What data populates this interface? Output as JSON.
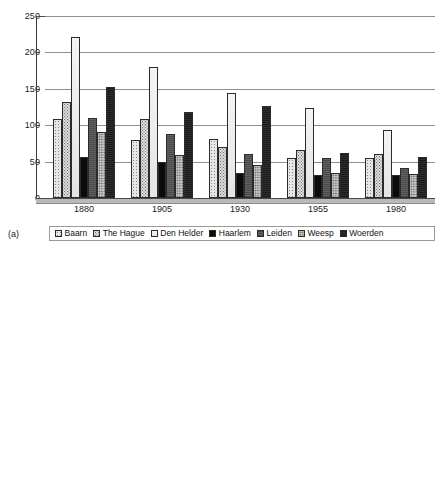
{
  "figure": {
    "panels": [
      {
        "tag": "(a)",
        "chart_data": {
          "type": "bar",
          "title": "",
          "xlabel": "",
          "ylabel": "",
          "categories": [
            "1880",
            "1905",
            "1930",
            "1955",
            "1980"
          ],
          "yticks": [
            0,
            50,
            100,
            150,
            200,
            250
          ],
          "ylim": [
            0,
            250
          ],
          "grid": true,
          "legend_position": "bottom",
          "series": [
            {
              "name": "Baarn",
              "values": [
                109,
                80,
                81,
                55,
                55
              ]
            },
            {
              "name": "The Hague",
              "values": [
                132,
                108,
                70,
                66,
                60
              ]
            },
            {
              "name": "Den Helder",
              "values": [
                221,
                180,
                144,
                124,
                94
              ]
            },
            {
              "name": "Haarlem",
              "values": [
                56,
                49,
                34,
                32,
                31
              ]
            },
            {
              "name": "Leiden",
              "values": [
                110,
                88,
                61,
                55,
                41
              ]
            },
            {
              "name": "Weesp",
              "values": [
                90,
                59,
                46,
                35,
                33
              ]
            },
            {
              "name": "Woerden",
              "values": [
                152,
                118,
                126,
                62,
                56
              ]
            }
          ]
        }
      },
      {
        "tag": "(b)",
        "chart_data": {
          "type": "bar",
          "title": "",
          "xlabel": "",
          "ylabel": "",
          "categories": [
            "1880",
            "1905",
            "1930",
            "1955",
            "1980"
          ],
          "yticks": [
            0,
            5,
            10,
            15,
            20,
            25
          ],
          "ylim": [
            0,
            25
          ],
          "grid": true,
          "legend_position": "bottom",
          "series": [
            {
              "name": "Baarn",
              "values": [
                11.5,
                11.4,
                3.7,
                1.8,
                1.2
              ]
            },
            {
              "name": "The Hague",
              "values": [
                19.3,
                14.9,
                6.3,
                3.3,
                2.1
              ]
            },
            {
              "name": "Den Helder",
              "values": [
                22.8,
                20.4,
                7.5,
                3.9,
                2.5
              ]
            },
            {
              "name": "Haarlem",
              "values": [
                5.8,
                4.6,
                2.1,
                1.0,
                0.7
              ]
            },
            {
              "name": "Leiden",
              "values": [
                16.6,
                13.9,
                4.7,
                2.4,
                1.6
              ]
            },
            {
              "name": "Weesp",
              "values": [
                4.7,
                3.6,
                1.3,
                0.6,
                0.3
              ]
            },
            {
              "name": "Woerden",
              "values": [
                10.3,
                9.0,
                3.9,
                1.9,
                1.2
              ]
            }
          ]
        }
      }
    ],
    "legend": {
      "entries": [
        {
          "label": "Baarn",
          "swatch": "pattern-sparse-dots"
        },
        {
          "label": "The Hague",
          "swatch": "pattern-checker-dots"
        },
        {
          "label": "Den Helder",
          "swatch": "pattern-white"
        },
        {
          "label": "Haarlem",
          "swatch": "solid-black"
        },
        {
          "label": "Leiden",
          "swatch": "solid-dark-grey"
        },
        {
          "label": "Weesp",
          "swatch": "pattern-medium-dots"
        },
        {
          "label": "Woerden",
          "swatch": "solid-near-black"
        }
      ]
    },
    "colors": {
      "axis": "#3a3a3a",
      "gridline": "#8e8e8e",
      "text": "#1a1a1a",
      "background": "#ffffff"
    }
  }
}
